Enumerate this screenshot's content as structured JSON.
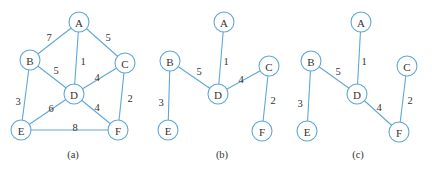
{
  "panels": [
    {
      "caption": "(a)",
      "nodes": [
        {
          "id": "A",
          "x": 79,
          "y": 22
        },
        {
          "id": "B",
          "x": 30,
          "y": 60
        },
        {
          "id": "C",
          "x": 125,
          "y": 63
        },
        {
          "id": "D",
          "x": 74,
          "y": 94
        },
        {
          "id": "E",
          "x": 21,
          "y": 130
        },
        {
          "id": "F",
          "x": 118,
          "y": 130
        }
      ],
      "edges": [
        {
          "from": "A",
          "to": "B",
          "weight": "7",
          "lx": 49,
          "ly": 37
        },
        {
          "from": "A",
          "to": "C",
          "weight": "5",
          "lx": 108,
          "ly": 37
        },
        {
          "from": "A",
          "to": "D",
          "weight": "1",
          "lx": 83,
          "ly": 61
        },
        {
          "from": "B",
          "to": "D",
          "weight": "5",
          "lx": 56,
          "ly": 70
        },
        {
          "from": "C",
          "to": "D",
          "weight": "4",
          "lx": 97,
          "ly": 77
        },
        {
          "from": "B",
          "to": "E",
          "weight": "3",
          "lx": 18,
          "ly": 101
        },
        {
          "from": "D",
          "to": "E",
          "weight": "6",
          "lx": 51,
          "ly": 108
        },
        {
          "from": "D",
          "to": "F",
          "weight": "4",
          "lx": 97,
          "ly": 107
        },
        {
          "from": "C",
          "to": "F",
          "weight": "2",
          "lx": 130,
          "ly": 98
        },
        {
          "from": "E",
          "to": "F",
          "weight": "8",
          "lx": 75,
          "ly": 127
        }
      ]
    },
    {
      "caption": "(b)",
      "nodes": [
        {
          "id": "A",
          "x": 224,
          "y": 22
        },
        {
          "id": "B",
          "x": 170,
          "y": 61
        },
        {
          "id": "C",
          "x": 269,
          "y": 66
        },
        {
          "id": "D",
          "x": 218,
          "y": 94
        },
        {
          "id": "E",
          "x": 168,
          "y": 130
        },
        {
          "id": "F",
          "x": 262,
          "y": 131
        }
      ],
      "edges": [
        {
          "from": "A",
          "to": "D",
          "weight": "1",
          "lx": 226,
          "ly": 61
        },
        {
          "from": "B",
          "to": "D",
          "weight": "5",
          "lx": 199,
          "ly": 71
        },
        {
          "from": "C",
          "to": "D",
          "weight": "4",
          "lx": 241,
          "ly": 79
        },
        {
          "from": "B",
          "to": "E",
          "weight": "3",
          "lx": 161,
          "ly": 102
        },
        {
          "from": "C",
          "to": "F",
          "weight": "2",
          "lx": 273,
          "ly": 100
        }
      ]
    },
    {
      "caption": "(c)",
      "nodes": [
        {
          "id": "A",
          "x": 361,
          "y": 22
        },
        {
          "id": "B",
          "x": 311,
          "y": 61
        },
        {
          "id": "C",
          "x": 407,
          "y": 66
        },
        {
          "id": "D",
          "x": 357,
          "y": 94
        },
        {
          "id": "E",
          "x": 307,
          "y": 131
        },
        {
          "id": "F",
          "x": 399,
          "y": 132
        }
      ],
      "edges": [
        {
          "from": "A",
          "to": "D",
          "weight": "1",
          "lx": 364,
          "ly": 61
        },
        {
          "from": "B",
          "to": "D",
          "weight": "5",
          "lx": 338,
          "ly": 71
        },
        {
          "from": "D",
          "to": "F",
          "weight": "4",
          "lx": 379,
          "ly": 107
        },
        {
          "from": "B",
          "to": "E",
          "weight": "3",
          "lx": 300,
          "ly": 103
        },
        {
          "from": "C",
          "to": "F",
          "weight": "2",
          "lx": 410,
          "ly": 100
        }
      ]
    }
  ],
  "caption_y": 158,
  "caption_x": [
    73,
    222,
    358
  ],
  "style": {
    "edge_color": "#5fa8d6",
    "node_radius": 10
  }
}
